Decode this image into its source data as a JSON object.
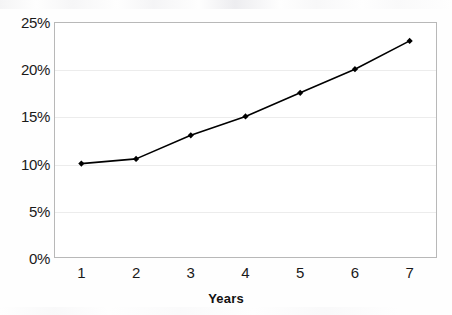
{
  "chart_data": {
    "type": "line",
    "title": "",
    "xlabel": "Years",
    "ylabel": "",
    "categories": [
      "1",
      "2",
      "3",
      "4",
      "5",
      "6",
      "7"
    ],
    "values": [
      10,
      10.5,
      13,
      15,
      17.5,
      20,
      23
    ],
    "series": [
      {
        "name": "",
        "values": [
          10,
          10.5,
          13,
          15,
          17.5,
          20,
          23
        ]
      }
    ],
    "ylim": [
      0,
      25
    ],
    "ytick_values": [
      0,
      5,
      10,
      15,
      20,
      25
    ],
    "ytick_labels": [
      "0%",
      "5%",
      "10%",
      "15%",
      "20%",
      "25%"
    ],
    "xtick_labels": [
      "1",
      "2",
      "3",
      "4",
      "5",
      "6",
      "7"
    ],
    "grid": "horizontal",
    "legend": "none",
    "marker": "filled-diamond",
    "line_color": "#000000",
    "marker_color": "#000000",
    "grid_color": "#ececec",
    "frame_color": "#b8b8b8",
    "background_color": "#ffffff"
  },
  "axis": {
    "x_title": "Years"
  }
}
